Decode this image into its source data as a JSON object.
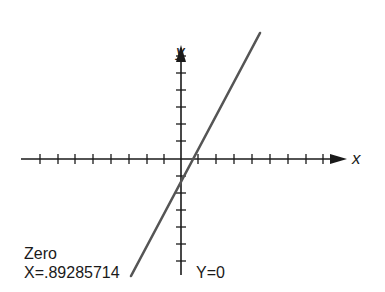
{
  "diagram": {
    "type": "coordinate-plane-line-graph",
    "axes": {
      "x_label": "x",
      "y_label": "y"
    },
    "annotations": {
      "zero_title": "Zero",
      "zero_value": "X=.89285714",
      "y_value": "Y=0"
    },
    "colors": {
      "axis": "#1a1a1a",
      "line": "#555555",
      "text": "#1a1a1a",
      "background": "#ffffff"
    }
  }
}
